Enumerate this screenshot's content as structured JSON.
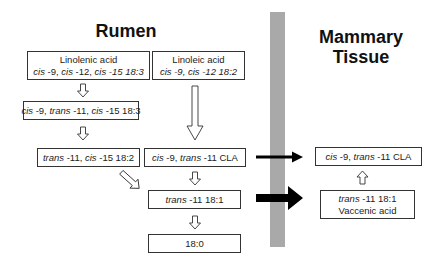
{
  "titles": {
    "rumen": "Rumen",
    "mammary_line1": "Mammary",
    "mammary_line2": "Tissue"
  },
  "rumen": {
    "linolenic": {
      "name": "Linolenic acid",
      "formula_parts": [
        "cis",
        " -9, ",
        "cis",
        " -12, ",
        "cis",
        " -15 18:3"
      ]
    },
    "linoleic": {
      "name": "Linoleic acid",
      "formula_parts": [
        "cis",
        " -9, ",
        "cis",
        " -12 18:2"
      ]
    },
    "intermediate_183": {
      "parts": [
        "cis",
        " -9, ",
        "trans",
        " -11, ",
        "cis",
        " -15 18:3"
      ]
    },
    "intermediate_182": {
      "parts": [
        "trans",
        " -11, ",
        "cis",
        " -15 18:2"
      ]
    },
    "cla": {
      "parts": [
        "cis",
        " -9, ",
        "trans",
        " -11 CLA"
      ]
    },
    "trans_181": {
      "parts": [
        "trans",
        " -11 18:1"
      ]
    },
    "stearic": {
      "label": "18:0"
    }
  },
  "mammary": {
    "cla": {
      "parts": [
        "cis",
        " -9, ",
        "trans",
        " -11 CLA"
      ]
    },
    "vaccenic": {
      "parts": [
        "trans",
        " -11 18:1"
      ],
      "name": "Vaccenic acid"
    }
  },
  "colors": {
    "membrane": "#a9a9a9",
    "arrow_fill": "#000000",
    "hollow_arrow_stroke": "#333333"
  }
}
